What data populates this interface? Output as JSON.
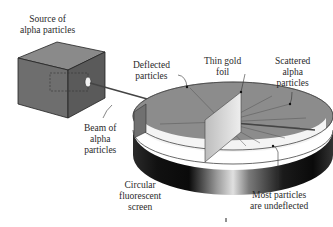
{
  "diagram": {
    "labels": {
      "source": [
        "Source of",
        "alpha particles"
      ],
      "deflected": [
        "Deflected",
        "particles"
      ],
      "foil": [
        "Thin gold",
        "foil"
      ],
      "scattered": [
        "Scattered",
        "alpha",
        "particles"
      ],
      "beam": [
        "Beam of",
        "alpha",
        "particles"
      ],
      "screen": [
        "Circular",
        "fluorescent",
        "screen"
      ],
      "undeflected": [
        "Most particles",
        "are undeflected"
      ]
    },
    "colors": {
      "box_front": "#6e6e6e",
      "box_top": "#8a8a8a",
      "box_side": "#5a5a5a",
      "screen_inner": "#8c8c8c",
      "screen_band_dark": "#111111",
      "screen_band_light": "#cfcfcf",
      "foil": "#d9d9d9",
      "text": "#2a2a2a"
    }
  }
}
